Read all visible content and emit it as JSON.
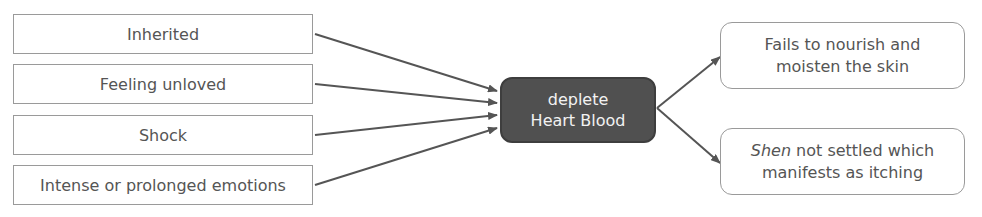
{
  "causes": [
    {
      "label": "Inherited"
    },
    {
      "label": "Feeling unloved"
    },
    {
      "label": "Shock"
    },
    {
      "label": "Intense or prolonged emotions"
    }
  ],
  "center": {
    "line1": "deplete",
    "line2": "Heart Blood"
  },
  "effects": [
    {
      "line1": "Fails to nourish and",
      "line2": "moisten the skin"
    },
    {
      "line1_italic": "Shen",
      "line1_rest": " not settled which",
      "line2": "manifests as itching"
    }
  ],
  "colors": {
    "center_fill": "#505050",
    "border": "#9a9a9a",
    "arrow": "#555555",
    "text": "#555555"
  }
}
